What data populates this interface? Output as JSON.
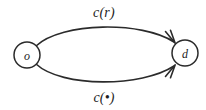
{
  "diagram": {
    "type": "directed-graph",
    "background_color": "#ffffff",
    "stroke_color": "#2b2b2b",
    "text_color": "#1d1d1d",
    "nodes": [
      {
        "id": "origin",
        "label": "o",
        "role": "source",
        "cx": 27,
        "cy": 55,
        "r": 13
      },
      {
        "id": "destination",
        "label": "d",
        "role": "target",
        "cx": 185,
        "cy": 53,
        "r": 13
      }
    ],
    "edges": [
      {
        "id": "upper-arc",
        "label": "c(r)",
        "from": "origin",
        "to": "destination",
        "curve": "arc-above",
        "arrowhead": "at-target",
        "label_x": 104,
        "label_y": 12
      },
      {
        "id": "lower-arc",
        "label": "c(•)",
        "from": "origin",
        "to": "destination",
        "curve": "arc-below",
        "arrowhead": "at-target",
        "label_x": 104,
        "label_y": 97
      }
    ]
  }
}
